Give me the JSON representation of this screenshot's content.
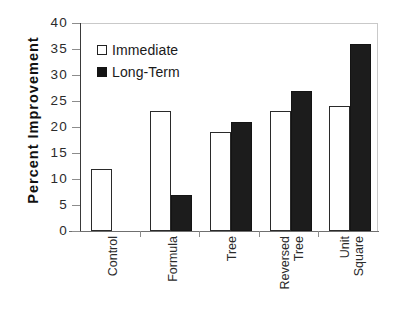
{
  "chart_data": {
    "type": "bar",
    "title": "",
    "xlabel": "",
    "ylabel": "Percent  Improvement",
    "ylim": [
      0,
      40
    ],
    "yticks": [
      0,
      5,
      10,
      15,
      20,
      25,
      30,
      35,
      40
    ],
    "grid": false,
    "legend_position": "top-left inside plot",
    "categories": [
      "Control",
      "Formula",
      "Tree",
      "Reversed Tree",
      "Unit Square"
    ],
    "category_lines": [
      [
        "Control"
      ],
      [
        "Formula"
      ],
      [
        "Tree"
      ],
      [
        "Reversed",
        "Tree"
      ],
      [
        "Unit",
        "Square"
      ]
    ],
    "series": [
      {
        "name": "Immediate",
        "swatch": "open-square",
        "color": "#ffffff",
        "edge_color": "#2a2a2a",
        "values": [
          12,
          23,
          19,
          23,
          24
        ]
      },
      {
        "name": "Long-Term",
        "swatch": "filled-square",
        "color": "#1c1c1c",
        "edge_color": "#141414",
        "values": [
          null,
          7,
          21,
          27,
          36
        ]
      }
    ]
  },
  "colors": {
    "background": "#ffffff",
    "axis": "#3a3a3a",
    "frame": "#c9c9c9",
    "text": "#1a1a1a"
  }
}
